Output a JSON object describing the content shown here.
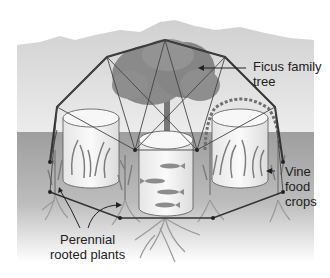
{
  "diagram": {
    "type": "illustration",
    "labels": {
      "ficus": [
        "Ficus family",
        "tree"
      ],
      "vine": [
        "Vine",
        "food",
        "crops"
      ],
      "perennial": [
        "Perennial",
        "rooted plants"
      ]
    },
    "colors": {
      "mountains": "#c9c9c9",
      "sky_band": "#e2e2e2",
      "ground": "#a9a9a9",
      "tree_foliage": "#8a8a8a",
      "frame": "#333333",
      "tank": "#f4f4f4",
      "fish": "#8c8c8c",
      "plants": "#7d7d7d",
      "roots": "#9a9a9a"
    }
  }
}
